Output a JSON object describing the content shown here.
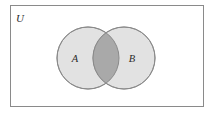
{
  "figure": {
    "name": "venn-diagram-two-sets-intersection",
    "background_color": "#ffffff"
  },
  "universe": {
    "label": "U",
    "border_color": "#8a8a8a",
    "fill_color": "#ffffff",
    "x": 10,
    "y": 5,
    "width": 193,
    "height": 101,
    "label_x": 20,
    "label_y": 22
  },
  "sets": [
    {
      "label": "A",
      "cx": 88,
      "cy": 58,
      "r": 31,
      "fill_color": "#e2e2e2",
      "stroke_color": "#8a8a8a",
      "label_x": 75,
      "label_y": 62
    },
    {
      "label": "B",
      "cx": 124,
      "cy": 58,
      "r": 31,
      "fill_color": "#e2e2e2",
      "stroke_color": "#8a8a8a",
      "label_x": 132,
      "label_y": 62
    }
  ],
  "intersection": {
    "name": "A intersect B",
    "fill_color": "#a9a9a9",
    "stroke_color": "#8a8a8a",
    "shaded": true
  },
  "chart_data": {
    "type": "diagram",
    "diagram_type": "venn",
    "title": "",
    "set_count": 2,
    "set_labels": [
      "A",
      "B"
    ],
    "universe_label": "U",
    "shaded_regions": [
      "A∩B"
    ],
    "unshaded_regions": [
      "A only",
      "B only",
      "outside A∪B"
    ],
    "legend": [],
    "annotations": []
  }
}
